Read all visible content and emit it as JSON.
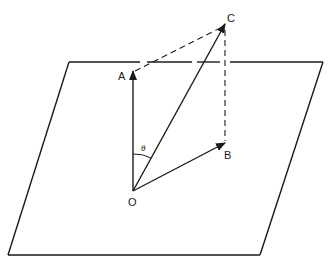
{
  "diagram": {
    "type": "vector-decomposition",
    "plane": {
      "shape": "parallelogram",
      "corners": [
        [
          69,
          62
        ],
        [
          323,
          62
        ],
        [
          260,
          255
        ],
        [
          8,
          255
        ]
      ]
    },
    "points": {
      "O": {
        "label": "O",
        "x": 133,
        "y": 191
      },
      "A": {
        "label": "A",
        "x": 133,
        "y": 71
      },
      "B": {
        "label": "B",
        "x": 224,
        "y": 143
      },
      "C": {
        "label": "C",
        "x": 225,
        "y": 24
      }
    },
    "vectors": [
      {
        "from": "O",
        "to": "A",
        "name": "OA"
      },
      {
        "from": "O",
        "to": "B",
        "name": "OB"
      },
      {
        "from": "O",
        "to": "C",
        "name": "OC"
      }
    ],
    "dashed_lines": [
      {
        "from": "A",
        "to": "C"
      },
      {
        "from": "B",
        "to": "C"
      }
    ],
    "angle": {
      "label": "θ",
      "between": [
        "OA",
        "OC"
      ],
      "vertex": "O"
    },
    "colors": {
      "stroke": "#1a1a1a",
      "background": "#ffffff"
    }
  }
}
